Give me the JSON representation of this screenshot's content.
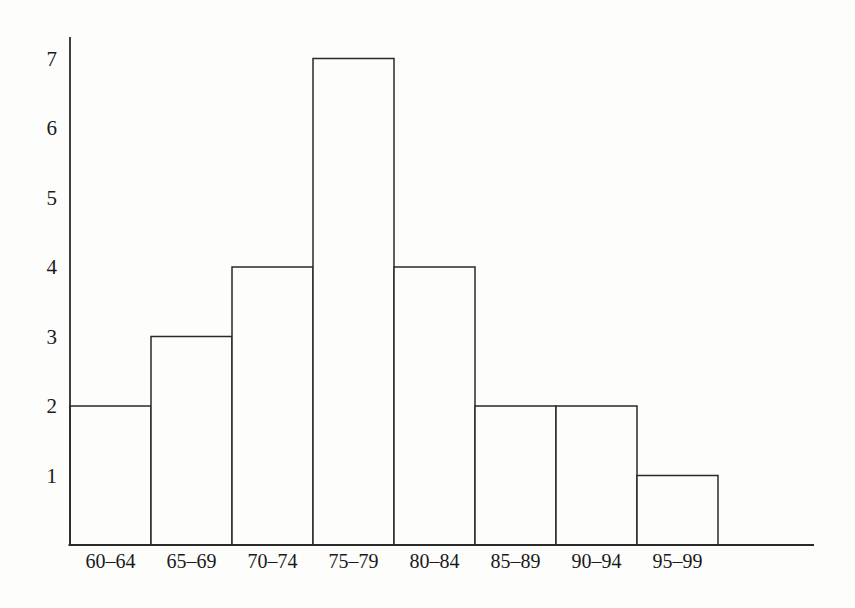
{
  "chart_data": {
    "type": "bar",
    "variant": "histogram",
    "categories": [
      "60–64",
      "65–69",
      "70–74",
      "75–79",
      "80–84",
      "85–89",
      "90–94",
      "95–99"
    ],
    "values": [
      2,
      3,
      4,
      7,
      4,
      2,
      2,
      1
    ],
    "title": "",
    "xlabel": "",
    "ylabel": "",
    "ylim": [
      0,
      7
    ],
    "yticks": [
      1,
      2,
      3,
      4,
      5,
      6,
      7
    ],
    "grid": false,
    "legend": "none",
    "bar_gap": 0,
    "colors": {
      "bar_fill": "#fdfdfc",
      "stroke": "#2a2a2a",
      "text": "#1a1a1a",
      "background": "#fdfdfc"
    }
  }
}
